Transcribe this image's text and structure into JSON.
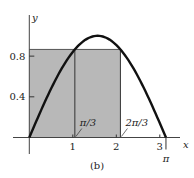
{
  "chart_data": {
    "type": "area",
    "title": "",
    "caption": "(b)",
    "xlabel": "x",
    "ylabel": "y",
    "xlim": [
      0,
      3.45
    ],
    "ylim": [
      0,
      1.0
    ],
    "curve": {
      "function": "sin(x)",
      "domain": [
        0,
        3.14159
      ]
    },
    "shaded_rectangle": {
      "x_from": 0,
      "x_to": 2.0944,
      "height": 0.866
    },
    "vertical_lines": [
      {
        "x": 1.0472,
        "label": "π/3"
      },
      {
        "x": 2.0944,
        "label": "2π/3"
      }
    ],
    "x_ticks": [
      {
        "value": 1,
        "label": "1"
      },
      {
        "value": 2,
        "label": "2"
      },
      {
        "value": 3,
        "label": "3"
      }
    ],
    "x_special": {
      "value": 3.14159,
      "label": "π"
    },
    "y_ticks": [
      {
        "value": 0.4,
        "label": "0.4"
      },
      {
        "value": 0.8,
        "label": "0.8"
      }
    ],
    "colors": {
      "shade": "#b8b8b8",
      "curve": "#111111",
      "axis": "#444444"
    }
  }
}
